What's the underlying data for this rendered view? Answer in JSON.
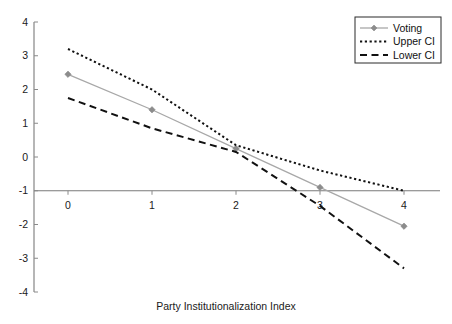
{
  "chart_data": {
    "type": "line",
    "title": "",
    "xlabel": "Party Institutionalization Index",
    "ylabel": "",
    "x": [
      0,
      1,
      2,
      3,
      4
    ],
    "xticklabels": [
      "0",
      "1",
      "2",
      "3",
      "4"
    ],
    "yticklabels": [
      "4",
      "3",
      "2",
      "1",
      "0",
      "-1",
      "-2",
      "-3",
      "-4"
    ],
    "yticks": [
      4,
      3,
      2,
      1,
      0,
      -1,
      -2,
      -3,
      -4
    ],
    "xlim": [
      -0.35,
      4.45
    ],
    "ylim": [
      -4,
      4
    ],
    "grid": false,
    "legend_position": "top-right",
    "series": [
      {
        "name": "Voting",
        "values": [
          2.45,
          1.4,
          0.25,
          -0.9,
          -2.05
        ],
        "style": "solid",
        "color": "#a8a8a8",
        "marker": "diamond",
        "marker_color": "#8c8c8c"
      },
      {
        "name": "Upper CI",
        "values": [
          3.2,
          2.0,
          0.35,
          -0.4,
          -1.0
        ],
        "style": "dotted",
        "color": "#111111",
        "marker": "none",
        "marker_color": "#111111"
      },
      {
        "name": "Lower CI",
        "values": [
          1.75,
          0.85,
          0.15,
          -1.45,
          -3.3
        ],
        "style": "dashed",
        "color": "#111111",
        "marker": "none",
        "marker_color": "#111111"
      }
    ]
  },
  "axis": {
    "x_title": "Party Institutionalization Index",
    "baseline_value": -1
  },
  "legend": {
    "entries": [
      {
        "label": "Voting"
      },
      {
        "label": "Upper CI"
      },
      {
        "label": "Lower CI"
      }
    ]
  },
  "colors": {
    "voting": "#a8a8a8",
    "ci": "#111111",
    "axis": "#7a7a7a",
    "text": "#1a1a1a",
    "background": "#ffffff"
  }
}
